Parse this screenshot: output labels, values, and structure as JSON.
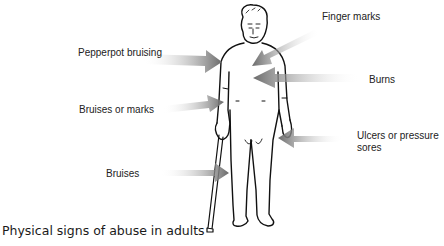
{
  "top_text_partial": "Ɛ̲ ̲ɜ ̲ ̲ ̲ ̲ ̲ ̲ ̲ ̲",
  "figure": {
    "labels": {
      "finger_marks": "Finger marks",
      "pepperpot_bruising": "Pepperpot bruising",
      "burns": "Burns",
      "bruises_or_marks": "Bruises or marks",
      "ulcers": "Ulcers or pressure sores",
      "ulcers_line1": "Ulcers or pressure",
      "ulcers_line2": "sores",
      "bruises": "Bruises"
    },
    "arrow_color_dark": "#6e6e6e",
    "arrow_color_light": "#ffffff"
  },
  "caption": "Physical signs of abuse in adults"
}
